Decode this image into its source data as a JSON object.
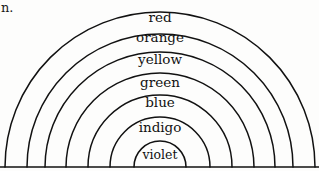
{
  "figure": {
    "type": "line-drawing",
    "caption_fragment": "n.",
    "background_color": "#fdfdfc",
    "ink_color": "#111111",
    "baseline": {
      "present": true,
      "y": 167,
      "x_start": 0,
      "x_end": 319
    },
    "geometry": {
      "center_x": 160,
      "center_y": 167,
      "arc_count": 7,
      "arc_radii": [
        155,
        133,
        115,
        94,
        72,
        50,
        26
      ]
    },
    "bands": [
      {
        "name": "red",
        "label": "red",
        "radius": 155,
        "label_x": 160,
        "label_y": 18
      },
      {
        "name": "orange",
        "label": "orange",
        "radius": 133,
        "label_x": 160,
        "label_y": 38
      },
      {
        "name": "yellow",
        "label": "yellow",
        "radius": 115,
        "label_x": 160,
        "label_y": 60
      },
      {
        "name": "green",
        "label": "green",
        "radius": 94,
        "label_x": 160,
        "label_y": 83
      },
      {
        "name": "blue",
        "label": "blue",
        "radius": 72,
        "label_x": 160,
        "label_y": 103
      },
      {
        "name": "indigo",
        "label": "indigo",
        "radius": 50,
        "label_x": 160,
        "label_y": 128
      },
      {
        "name": "violet",
        "label": "violet",
        "radius": 26,
        "label_x": 160,
        "label_y": 155
      }
    ]
  }
}
